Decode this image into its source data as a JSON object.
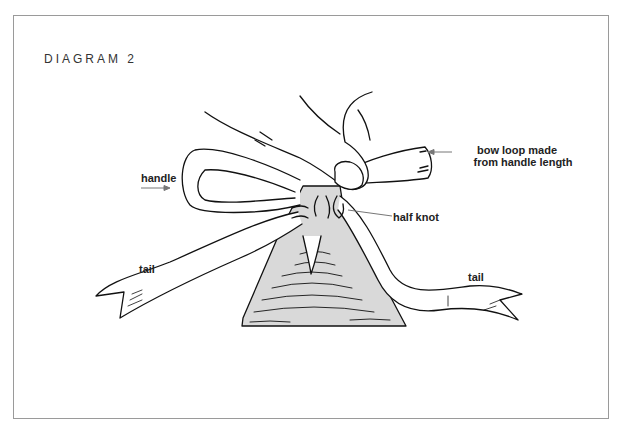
{
  "diagram": {
    "title": "DIAGRAM 2",
    "labels": {
      "handle": "handle",
      "bow_loop_line1": "bow loop made",
      "bow_loop_line2": "from handle length",
      "half_knot": "half knot",
      "tail_left": "tail",
      "tail_right": "tail"
    },
    "colors": {
      "border": "#9a9a9a",
      "line": "#111111",
      "bag_fill": "#d9d9d9",
      "arrow": "#777777"
    }
  }
}
